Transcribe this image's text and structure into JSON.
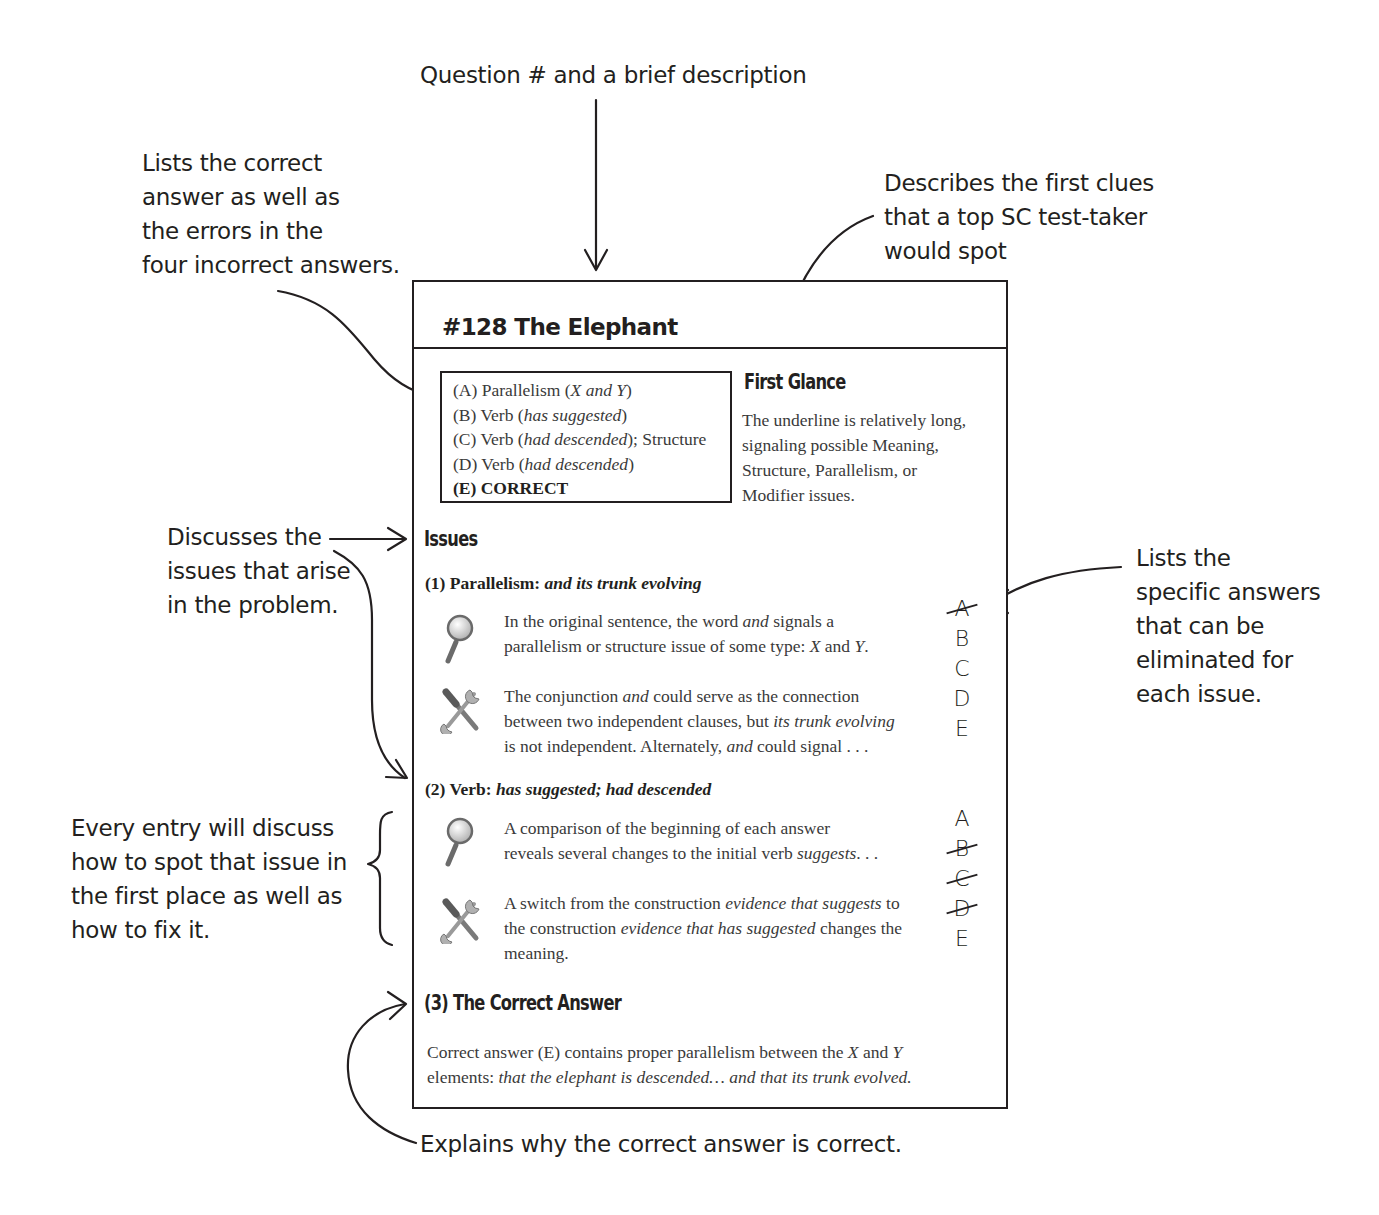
{
  "annotations": {
    "top": "Question # and a brief description",
    "answers_list": [
      "Lists the correct",
      "answer as well as",
      "the errors in the",
      "four incorrect answers."
    ],
    "first_glance": [
      "Describes the first clues",
      "that a top SC test-taker",
      "would spot"
    ],
    "issues": [
      "Discusses the",
      "issues that arise",
      "in the problem."
    ],
    "eliminate": [
      "Lists the",
      "specific answers",
      "that can be",
      "eliminated for",
      "each issue."
    ],
    "spot_fix": [
      "Every entry will discuss",
      "how to spot that issue in",
      "the first place as well as",
      "how to fix it."
    ],
    "correct": "Explains why the correct answer is correct."
  },
  "card": {
    "title": "#128 The Elephant",
    "answers": [
      {
        "label": "(A) Parallelism (",
        "em": "X and Y",
        "tail": ")"
      },
      {
        "label": "(B) Verb (",
        "em": "has suggested",
        "tail": ")"
      },
      {
        "label": "(C) Verb (",
        "em": "had descended",
        "tail": "); Structure"
      },
      {
        "label": "(D) Verb (",
        "em": "had descended",
        "tail": ")"
      },
      {
        "label": "(E) CORRECT",
        "em": "",
        "tail": ""
      }
    ],
    "first_glance": {
      "heading": "First Glance",
      "lines": [
        "The underline is relatively long,",
        "signaling possible Meaning,",
        "Structure, Parallelism, or",
        "Modifier issues."
      ]
    },
    "issues_heading": "Issues",
    "issues": [
      {
        "title": "(1) Parallelism: ",
        "title_em": "and its trunk evolving",
        "spot": {
          "icon": "magnifying-glass-icon",
          "l1a": "In the original sentence, the word ",
          "l1em": "and",
          "l1b": " signals a",
          "l2a": "parallelism or structure issue of some type: ",
          "l2em1": "X",
          "l2b": " and ",
          "l2em2": "Y",
          "l2c": "."
        },
        "fix": {
          "icon": "tools-icon",
          "l1a": "The conjunction ",
          "l1em": "and",
          "l1b": " could serve as the connection",
          "l2a": "between two independent clauses, but ",
          "l2em": "its trunk evolving",
          "l3a": "is not independent. Alternately, ",
          "l3em": "and",
          "l3b": " could signal . . ."
        },
        "eliminations": [
          {
            "letter": "A",
            "crossed": true
          },
          {
            "letter": "B",
            "crossed": false
          },
          {
            "letter": "C",
            "crossed": false
          },
          {
            "letter": "D",
            "crossed": false
          },
          {
            "letter": "E",
            "crossed": false
          }
        ]
      },
      {
        "title": "(2) Verb: ",
        "title_em": "has suggested; had descended",
        "spot": {
          "icon": "magnifying-glass-icon",
          "l1": "A comparison of the beginning of each answer",
          "l2a": "reveals several changes to the initial verb ",
          "l2em": "suggests",
          "l2b": ". . ."
        },
        "fix": {
          "icon": "tools-icon",
          "l1a": "A switch from the construction ",
          "l1em": "evidence that suggests",
          "l1b": " to",
          "l2a": "the construction ",
          "l2em": "evidence that has suggested",
          "l2b": " changes the",
          "l3": "meaning."
        },
        "eliminations": [
          {
            "letter": "A",
            "crossed": false
          },
          {
            "letter": "B",
            "crossed": true
          },
          {
            "letter": "C",
            "crossed": true
          },
          {
            "letter": "D",
            "crossed": true
          },
          {
            "letter": "E",
            "crossed": false
          }
        ]
      }
    ],
    "correct": {
      "heading": "(3) The Correct Answer",
      "l1a": "Correct answer (E) contains proper parallelism between the ",
      "l1em1": "X",
      "l1b": " and ",
      "l1em2": "Y",
      "l2a": "elements: ",
      "l2em": "that the elephant is descended… and that its trunk evolved."
    }
  }
}
